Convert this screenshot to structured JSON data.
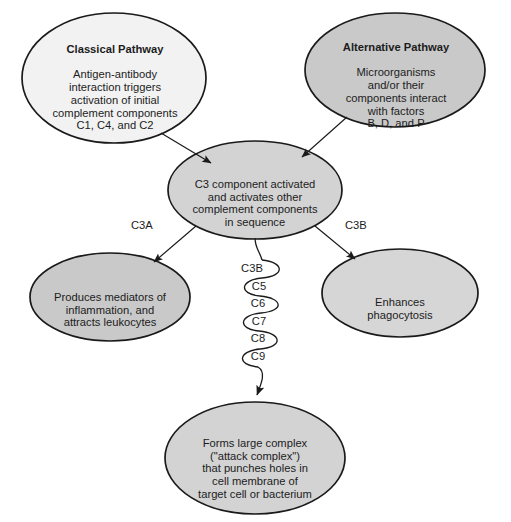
{
  "diagram": {
    "background_color": "#ffffff",
    "stroke_color": "#1a1a1a",
    "text_color": "#1c1c1c",
    "nodes": {
      "classical": {
        "title": "Classical Pathway",
        "body": "Antigen-antibody\ninteraction triggers\nactivation of initial\ncomplement components\nC1, C4, and C2",
        "fill": "#f2f2f2"
      },
      "alternative": {
        "title": "Alternative Pathway",
        "body": "Microorganisms\nand/or their\ncomponents interact\nwith factors\nB, D, and P",
        "fill": "#c9c9c9"
      },
      "c3": {
        "title": "",
        "body": "C3 component activated\nand activates other\ncomplement components\nin sequence",
        "fill": "#d3d3d3"
      },
      "mediators": {
        "title": "",
        "body": "Produces mediators of\ninflammation, and\nattracts leukocytes",
        "fill": "#c9c9c9"
      },
      "phagocytosis": {
        "title": "",
        "body": "Enhances\nphagocytosis",
        "fill": "#d6d6d6"
      },
      "attack_complex": {
        "title": "",
        "body": "Forms large complex\n(\"attack complex\")\nthat punches holes in\ncell membrane of\ntarget cell or bacterium",
        "fill": "#d3d3d3"
      }
    },
    "edge_labels": {
      "c3a": "C3A",
      "c3b": "C3B"
    },
    "chain": {
      "labels": [
        "C3B",
        "C5",
        "C6",
        "C7",
        "C8",
        "C9"
      ]
    }
  }
}
